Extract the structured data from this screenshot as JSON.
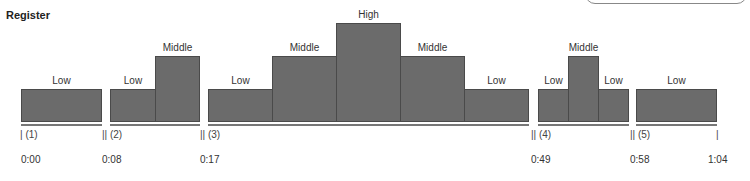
{
  "title": "Register",
  "levels": {
    "Low": 33,
    "Middle": 65,
    "High": 98
  },
  "sections": [
    {
      "marker": "| (1)",
      "time": "0:00"
    },
    {
      "marker": "|| (2)",
      "time": "0:08"
    },
    {
      "marker": "|| (3)",
      "time": "0:17"
    },
    {
      "marker": "|| (4)",
      "time": "0:49"
    },
    {
      "marker": "|| (5)",
      "time": "0:58"
    },
    {
      "marker": "|",
      "time": "1:04"
    }
  ],
  "bars": [
    {
      "label": "Low",
      "level": "Low",
      "section": 1
    },
    {
      "label": "Low",
      "level": "Low",
      "section": 2
    },
    {
      "label": "Middle",
      "level": "Middle",
      "section": 2
    },
    {
      "label": "Low",
      "level": "Low",
      "section": 3
    },
    {
      "label": "Middle",
      "level": "Middle",
      "section": 3
    },
    {
      "label": "High",
      "level": "High",
      "section": 3
    },
    {
      "label": "Middle",
      "level": "Middle",
      "section": 3
    },
    {
      "label": "Low",
      "level": "Low",
      "section": 3
    },
    {
      "label": "Low",
      "level": "Low",
      "section": 4
    },
    {
      "label": "Middle",
      "level": "Middle",
      "section": 4
    },
    {
      "label": "Low",
      "level": "Low",
      "section": 4
    },
    {
      "label": "Low",
      "level": "Low",
      "section": 5
    }
  ],
  "colors": {
    "bar": "#6b6b6b",
    "bar_border": "#4a4a4a",
    "baseline": "#777777"
  }
}
